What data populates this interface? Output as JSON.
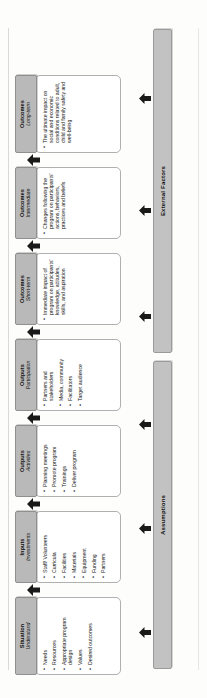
{
  "diagram": {
    "orientation": "rotated-90-ccw",
    "colors": {
      "header_fill": "#b9b9b9",
      "header_border": "#8f8f8f",
      "body_fill": "#ffffff",
      "body_border": "#b0b0b0",
      "bar_fill": "#c2c2c2",
      "bar_border": "#9a9a9a",
      "arrow_fill": "#1a1a1a",
      "page_background": "#fdfdfc"
    }
  },
  "columns": [
    {
      "id": "situation",
      "title": "Situation",
      "subtitle": "Understand",
      "items": [
        "Needs",
        "Resources",
        "Appropriate program design",
        "Values",
        "Desired outcomes"
      ]
    },
    {
      "id": "inputs",
      "title": "Inputs",
      "subtitle": "Investments",
      "items": [
        "Staff/ Volunteers",
        "Curricula",
        "Facilities",
        "Materials",
        "Equipment",
        "Funding",
        "Partners"
      ]
    },
    {
      "id": "outputs-activities",
      "title": "Outputs",
      "subtitle": "Activities",
      "items": [
        "Planning meetings",
        "Promote program",
        "Trainings",
        "Deliver program"
      ]
    },
    {
      "id": "outputs-participation",
      "title": "Outputs",
      "subtitle": "Participation",
      "items": [
        "Partners and stakeholders",
        "Media, community",
        "Facilitators",
        "Target audience"
      ]
    },
    {
      "id": "outcomes-short-term",
      "title": "Outcomes",
      "subtitle": "Short-term",
      "paragraph": "Immediate impact of program on participants' knowledge, attitudes, skills, and aspiration"
    },
    {
      "id": "outcomes-intermediate",
      "title": "Outcomes",
      "subtitle": "Intermediate",
      "paragraph": "Changes following the program on participants' actions, behaviors, practices and beliefs"
    },
    {
      "id": "outcomes-long-term",
      "title": "Outcomes",
      "subtitle": "Long-term",
      "paragraph": "The ultimate impact on social and economic conditions related to adult, child and family safety and well-being"
    }
  ],
  "bars": [
    {
      "id": "assumptions",
      "label": "Assumptions",
      "arrow_count": 3
    },
    {
      "id": "external-factors",
      "label": "External Factors",
      "arrow_count": 3
    }
  ]
}
